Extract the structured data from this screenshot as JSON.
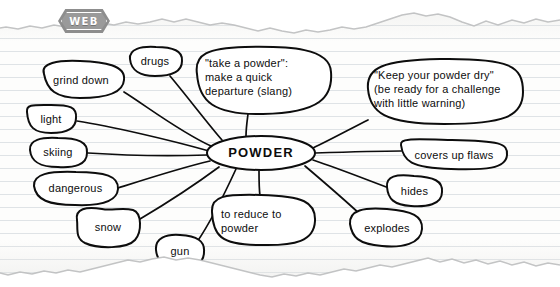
{
  "badge": {
    "label": "WEB",
    "icon": "hexagon-tab-icon",
    "color": "#8d8d8d"
  },
  "paper": {
    "bg_color": "#fdfdfc",
    "rule_color": "#dfe3e6",
    "ink_color": "#0d0d0d",
    "torn_top": true,
    "torn_bottom": true
  },
  "diagram": {
    "type": "word-web",
    "center": {
      "id": "powder",
      "label": "POWDER",
      "x": 261,
      "y": 153,
      "rx": 54,
      "ry": 17
    },
    "nodes": [
      {
        "id": "grind-down",
        "label": "grind down",
        "x": 81,
        "y": 80,
        "rx": 44,
        "ry": 18,
        "align": "center"
      },
      {
        "id": "drugs",
        "label": "drugs",
        "x": 155,
        "y": 61,
        "rx": 27,
        "ry": 14,
        "align": "center"
      },
      {
        "id": "take-a-powder",
        "label": "\"take a powder\":\nmake a quick\ndeparture (slang)",
        "x": 263,
        "y": 82,
        "rx": 68,
        "ry": 32,
        "align": "left"
      },
      {
        "id": "keep-powder-dry",
        "label": "\"Keep your powder dry\"\n(be ready for a challenge\nwith little warning)",
        "x": 445,
        "y": 92,
        "rx": 78,
        "ry": 30,
        "align": "left"
      },
      {
        "id": "light",
        "label": "light",
        "x": 51,
        "y": 119,
        "rx": 25,
        "ry": 13,
        "align": "center"
      },
      {
        "id": "skiing",
        "label": "skiing",
        "x": 58,
        "y": 152,
        "rx": 29,
        "ry": 14,
        "align": "center"
      },
      {
        "id": "dangerous",
        "label": "dangerous",
        "x": 76,
        "y": 189,
        "rx": 42,
        "ry": 16,
        "align": "center"
      },
      {
        "id": "snow",
        "label": "snow",
        "x": 108,
        "y": 227,
        "rx": 32,
        "ry": 17,
        "align": "center"
      },
      {
        "id": "gun",
        "label": "gun",
        "x": 180,
        "y": 251,
        "rx": 24,
        "ry": 16,
        "align": "center"
      },
      {
        "id": "to-reduce-to-powder",
        "label": "to reduce to\npowder",
        "x": 263,
        "y": 220,
        "rx": 51,
        "ry": 25,
        "align": "left"
      },
      {
        "id": "explodes",
        "label": "explodes",
        "x": 386,
        "y": 228,
        "rx": 36,
        "ry": 18,
        "align": "center"
      },
      {
        "id": "hides",
        "label": "hides",
        "x": 414,
        "y": 191,
        "rx": 28,
        "ry": 14,
        "align": "center"
      },
      {
        "id": "covers-up-flaws",
        "label": "covers up flaws",
        "x": 453,
        "y": 155,
        "rx": 54,
        "ry": 14,
        "align": "center"
      }
    ],
    "edges": [
      {
        "from": "powder",
        "to": "grind-down"
      },
      {
        "from": "powder",
        "to": "drugs"
      },
      {
        "from": "powder",
        "to": "take-a-powder"
      },
      {
        "from": "powder",
        "to": "keep-powder-dry"
      },
      {
        "from": "powder",
        "to": "light"
      },
      {
        "from": "powder",
        "to": "skiing"
      },
      {
        "from": "powder",
        "to": "dangerous"
      },
      {
        "from": "powder",
        "to": "snow"
      },
      {
        "from": "powder",
        "to": "gun"
      },
      {
        "from": "powder",
        "to": "to-reduce-to-powder"
      },
      {
        "from": "powder",
        "to": "explodes"
      },
      {
        "from": "powder",
        "to": "hides"
      },
      {
        "from": "powder",
        "to": "covers-up-flaws"
      }
    ]
  }
}
